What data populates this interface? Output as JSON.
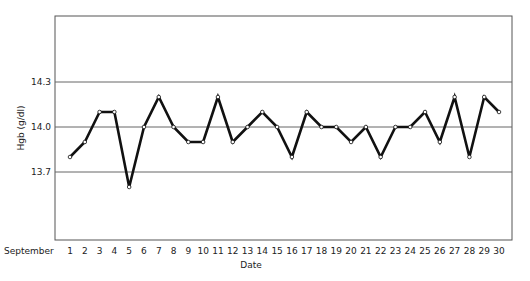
{
  "chart_data": {
    "type": "line",
    "title": "",
    "xlabel": "Date",
    "ylabel": "Hgb (g/dl)",
    "x_prefix_label": "September",
    "categories": [
      "1",
      "2",
      "3",
      "4",
      "5",
      "6",
      "7",
      "8",
      "9",
      "10",
      "11",
      "12",
      "13",
      "14",
      "15",
      "16",
      "17",
      "18",
      "19",
      "20",
      "21",
      "22",
      "23",
      "24",
      "25",
      "26",
      "27",
      "28",
      "29",
      "30"
    ],
    "series": [
      {
        "name": "Hgb",
        "values": [
          13.8,
          13.9,
          14.1,
          14.1,
          13.6,
          14.0,
          14.2,
          14.0,
          13.9,
          13.9,
          14.2,
          13.9,
          14.0,
          14.1,
          14.0,
          13.8,
          14.1,
          14.0,
          14.0,
          13.9,
          14.0,
          13.8,
          14.0,
          14.0,
          14.1,
          13.9,
          14.2,
          13.8,
          14.2,
          14.1
        ]
      }
    ],
    "yticks": [
      "14.3",
      "14.0",
      "13.7"
    ],
    "ytick_values": [
      14.3,
      14.0,
      13.7
    ],
    "ylim": [
      13.28,
      14.74
    ],
    "grid": "horizontal lines at ytick values",
    "legend": null,
    "marker": "small open circle",
    "line_color": "#111111"
  }
}
